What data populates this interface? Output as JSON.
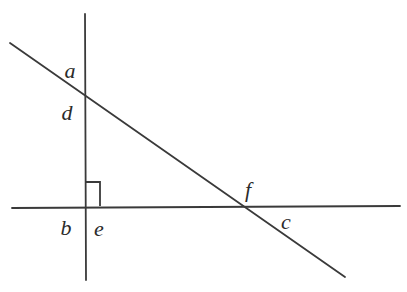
{
  "figure": {
    "type": "geometry-diagram",
    "width": 407,
    "height": 292,
    "background_color": "#ffffff",
    "stroke_color": "#3a3a3a",
    "label_color": "#2b2b2b",
    "lines": [
      {
        "name": "vertical-line",
        "x1": 85,
        "y1": 14,
        "x2": 86,
        "y2": 280
      },
      {
        "name": "horizontal-line",
        "x1": 12,
        "y1": 208,
        "x2": 400,
        "y2": 206
      },
      {
        "name": "oblique-line",
        "x1": 10,
        "y1": 43,
        "x2": 345,
        "y2": 277
      }
    ],
    "right_angle_marker": {
      "name": "right-angle-square",
      "points": "85,182 100,182 100,206",
      "size": 15
    },
    "intersections": [
      {
        "name": "vertical-oblique",
        "x": 85,
        "y": 86
      },
      {
        "name": "vertical-horizontal",
        "x": 85,
        "y": 207
      },
      {
        "name": "horizontal-oblique",
        "x": 240,
        "y": 207
      }
    ],
    "labels": [
      {
        "id": "a",
        "text": "a",
        "x": 70,
        "y": 71
      },
      {
        "id": "d",
        "text": "d",
        "x": 67,
        "y": 113
      },
      {
        "id": "b",
        "text": "b",
        "x": 66,
        "y": 228
      },
      {
        "id": "e",
        "text": "e",
        "x": 99,
        "y": 229
      },
      {
        "id": "f",
        "text": "f",
        "x": 248,
        "y": 190
      },
      {
        "id": "c",
        "text": "c",
        "x": 286,
        "y": 222
      }
    ]
  }
}
